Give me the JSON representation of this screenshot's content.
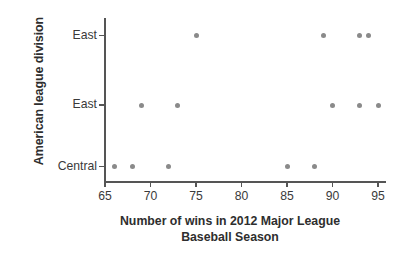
{
  "chart_data": {
    "type": "scatter",
    "title": "",
    "xlabel": "Number of wins in 2012 Major League Baseball Season",
    "xlabel_line1": "Number of wins in 2012 Major League",
    "xlabel_line2": "Baseball Season",
    "ylabel": "American league division",
    "xlim": [
      64,
      96
    ],
    "ylim": [
      0,
      3
    ],
    "xticks": [
      65,
      70,
      75,
      80,
      85,
      90,
      95
    ],
    "xtick_labels": [
      "65",
      "70",
      "75",
      "80",
      "85",
      "90",
      "95"
    ],
    "ycategories": [
      "Central",
      "East",
      "East"
    ],
    "ytick_labels_top_to_bottom": [
      "East",
      "East",
      "Central"
    ],
    "grid": false,
    "legend": false,
    "marker_color": "#8a8a8a",
    "axis_color": "#555555",
    "text_color": "#3a3a3a",
    "background": "#ffffff",
    "series": [
      {
        "name": "East",
        "category_index": 2,
        "values": [
          75,
          89,
          93,
          94
        ]
      },
      {
        "name": "East",
        "category_index": 1,
        "values": [
          69,
          73,
          90,
          93,
          95
        ]
      },
      {
        "name": "Central",
        "category_index": 0,
        "values": [
          66,
          68,
          72,
          85,
          88
        ]
      }
    ],
    "points": [
      {
        "x": 75,
        "row": 2
      },
      {
        "x": 89,
        "row": 2
      },
      {
        "x": 93,
        "row": 2
      },
      {
        "x": 94,
        "row": 2
      },
      {
        "x": 69,
        "row": 1
      },
      {
        "x": 73,
        "row": 1
      },
      {
        "x": 90,
        "row": 1
      },
      {
        "x": 93,
        "row": 1
      },
      {
        "x": 95,
        "row": 1
      },
      {
        "x": 66,
        "row": 0
      },
      {
        "x": 68,
        "row": 0
      },
      {
        "x": 72,
        "row": 0
      },
      {
        "x": 85,
        "row": 0
      },
      {
        "x": 88,
        "row": 0
      }
    ]
  }
}
